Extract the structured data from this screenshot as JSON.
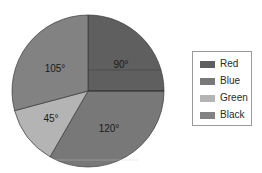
{
  "chart_data": {
    "type": "pie",
    "title": "",
    "unit": "degrees",
    "start_angle": 0,
    "direction": "clockwise",
    "center": [
      88,
      91
    ],
    "radius": 76,
    "slices": [
      {
        "name": "Red",
        "value": 90,
        "label": "90°",
        "color": "#5f5f5f",
        "label_pos": [
          121,
          68
        ]
      },
      {
        "name": "Blue",
        "value": 120,
        "label": "120°",
        "color": "#787878",
        "label_pos": [
          109,
          132
        ]
      },
      {
        "name": "Green",
        "value": 45,
        "label": "45°",
        "color": "#b4b4b4",
        "label_pos": [
          51,
          122
        ]
      },
      {
        "name": "Black",
        "value": 105,
        "label": "105°",
        "color": "#828282",
        "label_pos": [
          55,
          72
        ]
      }
    ],
    "legend": {
      "position": "right",
      "entries": [
        "Red",
        "Blue",
        "Green",
        "Black"
      ]
    }
  },
  "legend": {
    "items": [
      {
        "label": "Red",
        "color": "#5f5f5f"
      },
      {
        "label": "Blue",
        "color": "#787878"
      },
      {
        "label": "Green",
        "color": "#b4b4b4"
      },
      {
        "label": "Black",
        "color": "#828282"
      }
    ]
  }
}
